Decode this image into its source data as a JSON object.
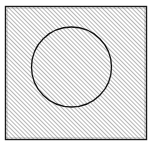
{
  "figure": {
    "title": "Hatched square with inscribed circle outline",
    "canvas": {
      "width": 153,
      "height": 147,
      "background_color": "#ffffff"
    },
    "shapes": [
      {
        "id": "square",
        "name": "outer-square",
        "kind": "rectangle",
        "x": 5.5,
        "y": 6.5,
        "width": 141,
        "height": 133,
        "stroke_color": "#1a1a1a",
        "stroke_width": 1.4,
        "fill": "diagonal-hatch"
      },
      {
        "id": "circle",
        "name": "inscribed-circle",
        "kind": "circle",
        "cx": 71.5,
        "cy": 67,
        "r": 40,
        "stroke_color": "#111111",
        "stroke_width": 1.3,
        "fill": "none"
      }
    ],
    "hatch": {
      "name": "diagonal-hatch-pattern",
      "angle_degrees": 45,
      "direction": "bottom-left-to-top-right",
      "spacing_px": 3,
      "line_width": 0.85,
      "line_color": "#4f4f4f",
      "background_color": "#ffffff",
      "covers": "entire square including circle interior"
    },
    "labels": {
      "caption": "",
      "annotations": []
    }
  },
  "chart_data": {
    "type": "diagram",
    "title": "Hatched square with inscribed circle",
    "elements": [
      {
        "shape": "square",
        "fill": "45-degree diagonal hatching",
        "bounds": {
          "left": 5.5,
          "top": 6.5,
          "right": 146.5,
          "bottom": 139.5
        }
      },
      {
        "shape": "circle",
        "fill": "none",
        "center": [
          71.5,
          67
        ],
        "radius": 40,
        "bounds": {
          "left": 31.5,
          "top": 27,
          "right": 111.5,
          "bottom": 107
        }
      }
    ]
  }
}
